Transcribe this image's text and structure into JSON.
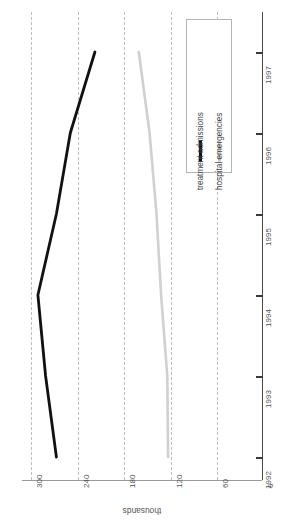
{
  "chart_data": {
    "type": "line",
    "title": "Cocaine-related hospital emergencies\nand treatment admissions, 1992–1997",
    "orientation": "rotated-90",
    "xlabel": "",
    "ylabel": "thousands",
    "x": [
      "1992",
      "1993",
      "1994",
      "1995",
      "1996",
      "1997"
    ],
    "categories": [
      "1992",
      "1993",
      "1994",
      "1995",
      "1996",
      "1997"
    ],
    "ylim": [
      0,
      300
    ],
    "yticks": [
      300,
      240,
      180,
      120,
      60,
      0
    ],
    "ytick_labels": [
      "300",
      "240",
      "180",
      "120",
      "60",
      "0"
    ],
    "grid": true,
    "grid_style": "dashed",
    "legend_position": "top-right",
    "series": [
      {
        "name": "treatment admissions",
        "color": "#111111",
        "values": [
          267,
          281,
          291,
          267,
          249,
          217
        ]
      },
      {
        "name": "hospital emergencies",
        "color": "#d0d0d0",
        "values": [
          122,
          123,
          131,
          137,
          146,
          160
        ]
      }
    ]
  },
  "axis": {
    "value_axis_title": "thousands",
    "tick_labels_values": [
      "300",
      "240",
      "180",
      "120",
      "60",
      "0"
    ],
    "tick_labels_years": [
      "1997",
      "1996",
      "1995",
      "1994",
      "1993",
      "1992"
    ]
  },
  "legend": {
    "entries": [
      {
        "label": "treatment admissions",
        "color": "#111111"
      },
      {
        "label": "hospital emergencies",
        "color": "#d0d0d0"
      }
    ]
  },
  "colors": {
    "series_dark": "#111111",
    "series_light": "#d0d0d0",
    "grid": "#bdbdbd",
    "axis": "#4a4a4a",
    "text": "#555555",
    "title": "#1c1c1c",
    "background": "#ffffff"
  }
}
